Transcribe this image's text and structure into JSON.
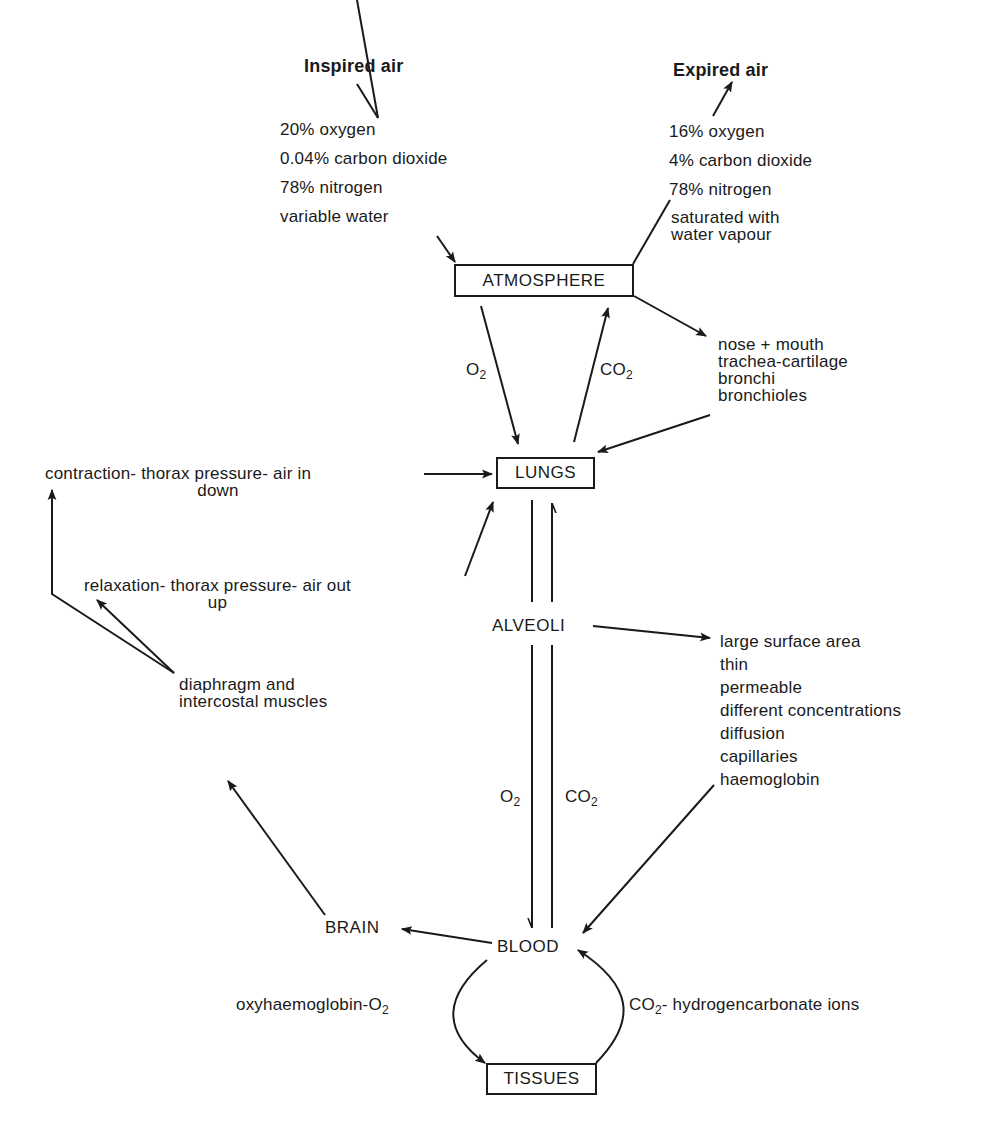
{
  "diagram": {
    "type": "respiration-flow-diagram",
    "inspired_air": {
      "title": "Inspired air",
      "composition": [
        "20% oxygen",
        "0.04% carbon dioxide",
        "78% nitrogen",
        "variable water"
      ]
    },
    "expired_air": {
      "title": "Expired air",
      "composition": [
        "16% oxygen",
        "4% carbon dioxide",
        "78% nitrogen",
        "saturated with",
        "water vapour"
      ]
    },
    "nodes": {
      "atmosphere": "ATMOSPHERE",
      "lungs": "LUNGS",
      "alveoli": "ALVEOLI",
      "blood": "BLOOD",
      "brain": "BRAIN",
      "tissues": "TISSUES"
    },
    "gas_labels": {
      "o2_prefix": "O",
      "co2_prefix": "CO",
      "subscript": "2"
    },
    "airways": [
      "nose + mouth",
      "trachea-cartilage",
      "bronchi",
      "bronchioles"
    ],
    "inhalation": {
      "line1": "contraction- thorax pressure- air in",
      "line2": "down"
    },
    "exhalation": {
      "line1": "relaxation- thorax pressure- air out",
      "line2": "up"
    },
    "muscles": [
      "diaphragm  and",
      "intercostal  muscles"
    ],
    "alveoli_features": [
      "large surface area",
      "thin",
      "permeable",
      "different concentrations",
      "diffusion",
      "capillaries",
      "haemoglobin"
    ],
    "transport": {
      "oxygen_prefix": "oxyhaemoglobin-O",
      "co2_suffix": "- hydrogencarbonate  ions"
    },
    "colors": {
      "ink": "#1a1a1a",
      "background": "#ffffff"
    }
  }
}
